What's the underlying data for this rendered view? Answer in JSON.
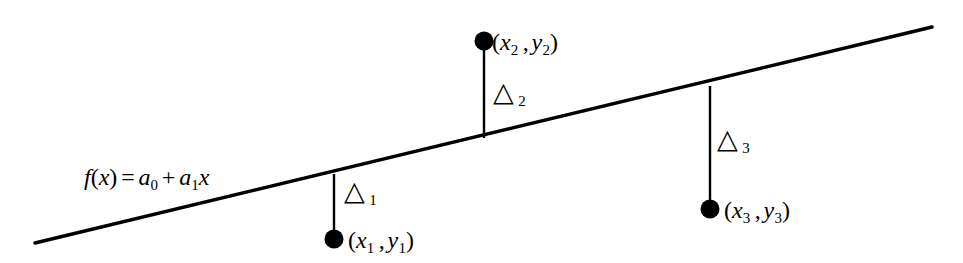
{
  "figure": {
    "name": "least-squares-residuals-diagram",
    "background_color": "#ffffff",
    "stroke_color": "#000000",
    "equation": {
      "f_name": "f",
      "open_paren": "(",
      "variable": "x",
      "close_paren": ")",
      "equals": "=",
      "term1_coeff": "a",
      "term1_sub": "0",
      "plus": "+",
      "term2_coeff": "a",
      "term2_sub": "1",
      "term2_var": "x",
      "full_text": "f(x) = a0 + a1x"
    },
    "regression_line": {
      "label": "regression-line",
      "x1": 35,
      "y1": 243,
      "x2": 932,
      "y2": 27,
      "stroke_width": 3.4
    },
    "points": [
      {
        "id": "point-1",
        "dot_cx": 334,
        "dot_cy": 239,
        "dot_r": 9.5,
        "stem_x": 334,
        "stem_y_top": 174,
        "stem_y_bottom": 231,
        "label_open": "(",
        "label_x_var": "x",
        "label_x_sub": "1",
        "label_comma": ",",
        "label_y_var": "y",
        "label_y_sub": "1",
        "label_close": ")",
        "label_text": "(x1 , y1)",
        "label_left": 348,
        "label_top": 228
      },
      {
        "id": "point-2",
        "dot_cx": 484,
        "dot_cy": 41,
        "dot_r": 9.5,
        "stem_x": 484,
        "stem_y_top": 49,
        "stem_y_bottom": 138,
        "label_open": "(",
        "label_x_var": "x",
        "label_x_sub": "2",
        "label_comma": ",",
        "label_y_var": "y",
        "label_y_sub": "2",
        "label_close": ")",
        "label_text": "(x2 , y2)",
        "label_left": 492,
        "label_top": 30
      },
      {
        "id": "point-3",
        "dot_cx": 710,
        "dot_cy": 209,
        "dot_r": 9.5,
        "stem_x": 710,
        "stem_y_top": 86,
        "stem_y_bottom": 201,
        "label_open": "(",
        "label_x_var": "x",
        "label_x_sub": "3",
        "label_comma": ",",
        "label_y_var": "y",
        "label_y_sub": "3",
        "label_close": ")",
        "label_text": "(x3 , y3)",
        "label_left": 724,
        "label_top": 198
      }
    ],
    "residuals": [
      {
        "id": "residual-1",
        "glyph": "△",
        "subscript": "1",
        "left": 344,
        "top": 178
      },
      {
        "id": "residual-2",
        "glyph": "△",
        "subscript": "2",
        "left": 493,
        "top": 79
      },
      {
        "id": "residual-3",
        "glyph": "△",
        "subscript": "3",
        "left": 717,
        "top": 126
      }
    ],
    "equation_position": {
      "left": 84,
      "top": 165
    }
  }
}
